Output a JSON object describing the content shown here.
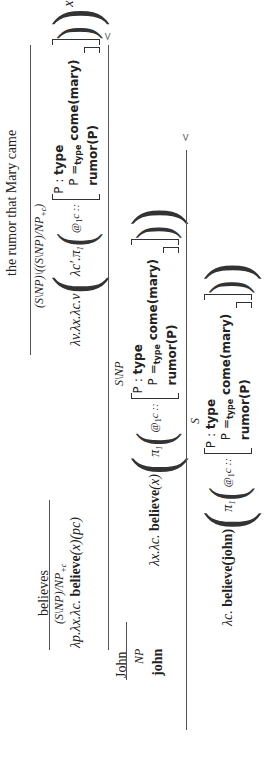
{
  "derivation": {
    "lexical": {
      "john": {
        "word": "John",
        "category": "NP",
        "semantics": "john"
      },
      "believes": {
        "word": "believes",
        "category": "(S\\NP)/NP+c",
        "category_main": "(S\\NP)/NP",
        "category_sub": "+c",
        "semantics_prefix": "λp.λx.λc.",
        "semantics_bold": "believe",
        "semantics_suffix": "(x)(pc)"
      },
      "rumor": {
        "word": "the rumor that Mary came",
        "category_main": "(S\\NP)\\((S\\NP)/NP",
        "category_sub": "+c",
        "category_close": ")",
        "semantics_prefix": "λv.λx.λc.v",
        "inner_lambda": "λc′.π",
        "pi_sub": "1",
        "at": "@",
        "at_sub": "1",
        "at_suffix": "c ::",
        "trailing": "xc"
      }
    },
    "record": {
      "row1_label": "P : ",
      "row1_value": "type",
      "row2_label": "P =",
      "row2_sub": "type",
      "row2_value": "come(mary)",
      "row3_value": "rumor(P)"
    },
    "step1": {
      "operator": "<",
      "category": "S\\NP",
      "semantics_prefix": "λx.λc.",
      "semantics_bold": "believe",
      "semantics_arg": "(x)",
      "pi": "π",
      "pi_sub": "1",
      "at": "@",
      "at_sub": "1",
      "at_suffix": "c ::"
    },
    "step2": {
      "operator": "<",
      "category": "S",
      "semantics_prefix": "λc.",
      "semantics_bold": "believe(john)",
      "pi": "π",
      "pi_sub": "1",
      "at": "@",
      "at_sub": "1",
      "at_suffix": "c ::"
    }
  }
}
